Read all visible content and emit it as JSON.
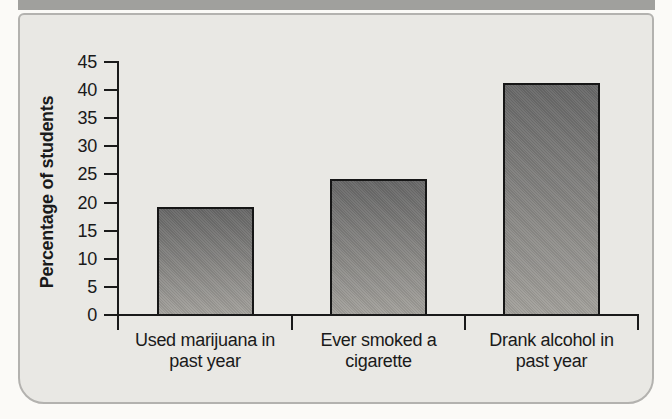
{
  "colors": {
    "page_bg": "#fbfaf7",
    "band": "#a0a09d",
    "panel_bg": "#e9e8e4",
    "panel_border": "#b3b2af",
    "axis": "#1a1a1a",
    "text": "#1a1a1a",
    "bar_top": "#686868",
    "bar_bottom": "#a3a19c",
    "bar_border": "#161616"
  },
  "chart_data": {
    "type": "bar",
    "ylabel": "Percentage of students",
    "categories": [
      "Used marijuana in past year",
      "Ever smoked a cigarette",
      "Drank alcohol in past year"
    ],
    "categories_display": [
      "Used marijuana in\npast year",
      "Ever smoked a\ncigarette",
      "Drank alcohol in\npast year"
    ],
    "values": [
      19,
      24,
      41
    ],
    "ylim": [
      0,
      45
    ],
    "ytick_step": 5,
    "ytick_labels": [
      "0",
      "5",
      "10",
      "15",
      "20",
      "25",
      "30",
      "35",
      "40",
      "45"
    ],
    "grid": false,
    "legend": false
  }
}
